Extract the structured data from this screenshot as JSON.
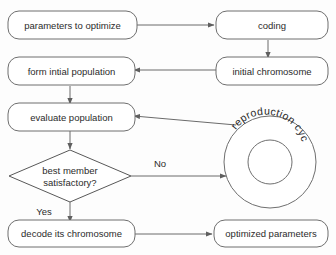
{
  "diagram": {
    "background_color": "#fdfdfd",
    "stroke_color": "#6b6b6b",
    "text_color": "#2b2b2b",
    "nodes": [
      {
        "id": "parameters",
        "shape": "rounded-rect",
        "label": "parameters to optimize"
      },
      {
        "id": "coding",
        "shape": "rounded-rect",
        "label": "coding"
      },
      {
        "id": "initial_chromosome",
        "shape": "rounded-rect",
        "label": "initial chromosome"
      },
      {
        "id": "form_population",
        "shape": "rounded-rect",
        "label": "form intial population"
      },
      {
        "id": "evaluate_population",
        "shape": "rounded-rect",
        "label": "evaluate population"
      },
      {
        "id": "decision",
        "shape": "diamond",
        "label_line1": "best member",
        "label_line2": "satisfactory?"
      },
      {
        "id": "reproduction_cycle",
        "shape": "ring",
        "label": "reproduction cycle"
      },
      {
        "id": "decode",
        "shape": "rounded-rect",
        "label": "decode its chromosome"
      },
      {
        "id": "optimized",
        "shape": "rounded-rect",
        "label": "optimized parameters"
      }
    ],
    "edge_labels": {
      "no": "No",
      "yes": "Yes"
    },
    "ring_text_letters": [
      "r",
      "e",
      "p",
      "r",
      "o",
      "d",
      "u",
      "c",
      "t",
      "i",
      "o",
      "n",
      " ",
      "c",
      "y",
      "c",
      "l",
      "e"
    ]
  }
}
